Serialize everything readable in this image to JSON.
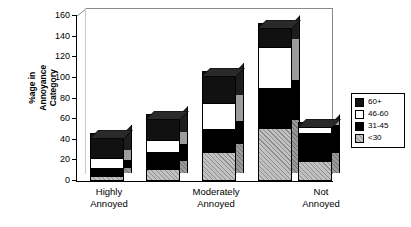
{
  "chart_data": {
    "type": "bar",
    "title": "",
    "subtitle": "",
    "xlabel": "",
    "ylabel": "%age in Annoyance Category",
    "ylabel_lines": [
      "%age in",
      "Annoyance",
      "Category"
    ],
    "ylim": [
      0,
      160
    ],
    "yticks": [
      0,
      20,
      40,
      60,
      80,
      100,
      120,
      140,
      160
    ],
    "grid": false,
    "stacked": true,
    "three_d": true,
    "legend_position": "right",
    "group_labels": [
      "Highly Annoyed",
      "Moderately Annoyed",
      "Not Annoyed"
    ],
    "group_label_lines": [
      [
        "Highly",
        "Annoyed"
      ],
      [
        "Moderately",
        "Annoyed"
      ],
      [
        "Not",
        "Annoyed"
      ]
    ],
    "categories": [
      "bar1",
      "bar2",
      "bar3",
      "bar4",
      "bar5"
    ],
    "series": [
      {
        "name": "<30",
        "color": "#c2c2c2",
        "pattern": "hatch-gray",
        "values": [
          5,
          12,
          28,
          51,
          19
        ]
      },
      {
        "name": "31-45",
        "color": "#ffffff",
        "pattern": "checker",
        "values": [
          8,
          16,
          22,
          39,
          28
        ]
      },
      {
        "name": "46-60",
        "color": "#ffffff",
        "pattern": "solid-white",
        "values": [
          9,
          12,
          26,
          40,
          5
        ]
      },
      {
        "name": "60+",
        "color": "#111111",
        "pattern": "solid-black",
        "values": [
          25,
          25,
          31,
          23,
          5
        ]
      }
    ],
    "totals": [
      47,
      65,
      107,
      153,
      57
    ],
    "legend_entries": [
      {
        "label": "60+",
        "pattern": "solid-black"
      },
      {
        "label": "46-60",
        "pattern": "solid-white"
      },
      {
        "label": "31-45",
        "pattern": "checker"
      },
      {
        "label": "<30",
        "pattern": "hatch-gray"
      }
    ]
  }
}
